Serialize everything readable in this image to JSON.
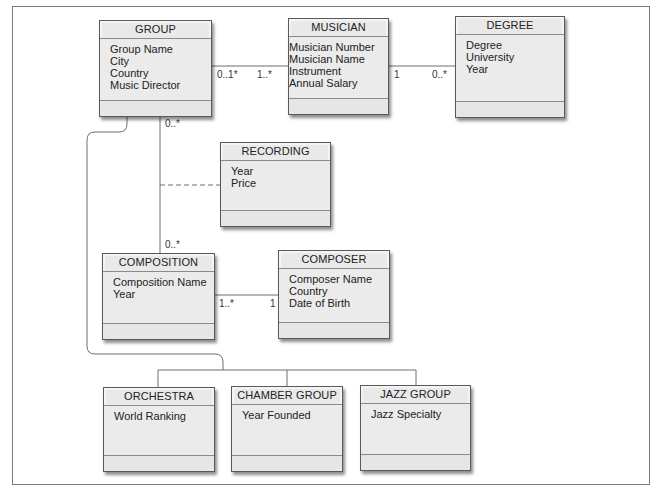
{
  "diagram": {
    "type": "UML class diagram",
    "classes": [
      {
        "id": "group",
        "name": "GROUP",
        "attributes": [
          "Group Name",
          "City",
          "Country",
          "Music Director"
        ]
      },
      {
        "id": "musician",
        "name": "MUSICIAN",
        "attributes": [
          "Musician Number",
          "Musician Name",
          "Instrument",
          "Annual Salary"
        ]
      },
      {
        "id": "degree",
        "name": "DEGREE",
        "attributes": [
          "Degree",
          "University",
          "Year"
        ]
      },
      {
        "id": "recording",
        "name": "RECORDING",
        "attributes": [
          "Year",
          "Price"
        ]
      },
      {
        "id": "composition",
        "name": "COMPOSITION",
        "attributes": [
          "Composition Name",
          "Year"
        ]
      },
      {
        "id": "composer",
        "name": "COMPOSER",
        "attributes": [
          "Composer Name",
          "Country",
          "Date of Birth"
        ]
      },
      {
        "id": "orchestra",
        "name": "ORCHESTRA",
        "attributes": [
          "World Ranking"
        ]
      },
      {
        "id": "chamber_group",
        "name": "CHAMBER GROUP",
        "attributes": [
          "Year Founded"
        ]
      },
      {
        "id": "jazz_group",
        "name": "JAZZ GROUP",
        "attributes": [
          "Jazz Specialty"
        ]
      }
    ],
    "associations": [
      {
        "from": "GROUP",
        "to": "MUSICIAN",
        "from_mult": "0..1*",
        "to_mult": "1..*"
      },
      {
        "from": "MUSICIAN",
        "to": "DEGREE",
        "from_mult": "1",
        "to_mult": "0..*"
      },
      {
        "from": "GROUP",
        "to": "COMPOSITION",
        "from_mult": "0..*",
        "to_mult": "0..*",
        "association_class": "RECORDING"
      },
      {
        "from": "COMPOSITION",
        "to": "COMPOSER",
        "from_mult": "1..*",
        "to_mult": "1"
      }
    ],
    "generalization": {
      "parent": "GROUP",
      "children": [
        "ORCHESTRA",
        "CHAMBER GROUP",
        "JAZZ GROUP"
      ]
    },
    "multiplicities": {
      "group_musician_left": "0..1*",
      "group_musician_right": "1..*",
      "musician_degree_left": "1",
      "musician_degree_right": "0..*",
      "group_composition_top": "0..*",
      "group_composition_bottom": "0..*",
      "composition_composer_left": "1..*",
      "composition_composer_right": "1"
    },
    "colors": {
      "box_fill": "#e9e9e9",
      "box_border": "#5a5a5a",
      "line": "#6a6a6a",
      "frame": "#7a7a7a"
    }
  }
}
